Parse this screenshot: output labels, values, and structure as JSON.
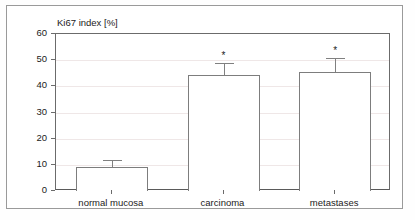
{
  "chart_data": {
    "type": "bar",
    "title": "Ki67 index [%]",
    "xlabel": "",
    "ylabel": "Ki67 index [%]",
    "categories": [
      "normal mucosa",
      "carcinoma",
      "metastases"
    ],
    "values": [
      9,
      44.3,
      45.5
    ],
    "errors_upper": [
      12,
      49,
      51
    ],
    "annotations": [
      "",
      "*",
      "*"
    ],
    "yticks": [
      0,
      10,
      20,
      30,
      40,
      50,
      60
    ],
    "ylim": [
      0,
      60
    ],
    "grid": true,
    "legend": "none",
    "bar_fill": "#ffffff",
    "bar_edge": "#7d7d7d",
    "error_color": "#808080",
    "axis_color": "#6b6b6b",
    "grid_color": "#efe7e7",
    "text_color": "#1b1b1b"
  }
}
